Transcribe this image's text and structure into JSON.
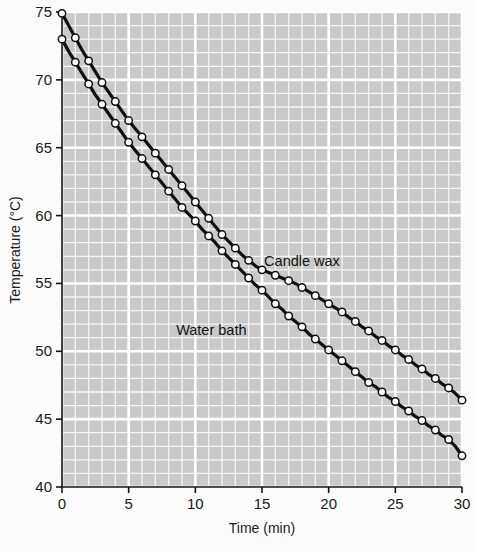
{
  "chart_data": {
    "type": "line",
    "title": "",
    "xlabel": "Time (min)",
    "ylabel": "Temperature (°C)",
    "xlim": [
      0,
      30
    ],
    "ylim": [
      40,
      75
    ],
    "xticks": [
      "0",
      "5",
      "10",
      "15",
      "20",
      "25",
      "30"
    ],
    "yticks": [
      "40",
      "45",
      "50",
      "55",
      "60",
      "65",
      "70",
      "75"
    ],
    "xtick_values": [
      0,
      5,
      10,
      15,
      20,
      25,
      30
    ],
    "ytick_values": [
      40,
      45,
      50,
      55,
      60,
      65,
      70,
      75
    ],
    "grid": true,
    "grid_major_step_x": 5,
    "grid_minor_step_x": 1,
    "grid_major_step_y": 5,
    "grid_minor_step_y": 1,
    "legend_position": "inline-annotation",
    "plot_background_color": "#c9c9c9",
    "grid_color": "#f5f5f5",
    "marker_style": "open-circle",
    "marker_face_color": "#ffffff",
    "marker_edge_color": "#101010",
    "line_color": "#101010",
    "series": [
      {
        "name": "Candle wax",
        "annotation_x": 18.0,
        "annotation_y": 56.3,
        "x": [
          0,
          0.5,
          1,
          1.5,
          2,
          2.5,
          3,
          3.5,
          4,
          4.5,
          5,
          5.5,
          6,
          6.5,
          7,
          7.5,
          8,
          8.5,
          9,
          9.5,
          10,
          10.5,
          11,
          11.5,
          12,
          12.5,
          13,
          13.5,
          14,
          14.5,
          15,
          15.5,
          16,
          16.5,
          17,
          17.5,
          18,
          18.5,
          19,
          19.5,
          20,
          20.5,
          21,
          21.5,
          22,
          22.5,
          23,
          23.5,
          24,
          24.5,
          25,
          25.5,
          26,
          26.5,
          27,
          27.5,
          28,
          28.5,
          29,
          29.5,
          30
        ],
        "values": [
          74.9,
          74.0,
          73.1,
          72.2,
          71.4,
          70.6,
          69.8,
          69.1,
          68.4,
          67.7,
          67.0,
          66.4,
          65.8,
          65.2,
          64.6,
          64.0,
          63.4,
          62.8,
          62.2,
          61.6,
          61.0,
          60.4,
          59.8,
          59.2,
          58.6,
          58.1,
          57.6,
          57.1,
          56.7,
          56.3,
          56.0,
          55.8,
          55.6,
          55.4,
          55.2,
          55.0,
          54.7,
          54.4,
          54.1,
          53.8,
          53.5,
          53.2,
          52.9,
          52.5,
          52.2,
          51.8,
          51.5,
          51.1,
          50.8,
          50.4,
          50.1,
          49.7,
          49.4,
          49.0,
          48.7,
          48.3,
          48.0,
          47.6,
          47.3,
          46.9,
          46.4
        ]
      },
      {
        "name": "Water bath",
        "annotation_x": 11.2,
        "annotation_y": 51.2,
        "x": [
          0,
          0.5,
          1,
          1.5,
          2,
          2.5,
          3,
          3.5,
          4,
          4.5,
          5,
          5.5,
          6,
          6.5,
          7,
          7.5,
          8,
          8.5,
          9,
          9.5,
          10,
          10.5,
          11,
          11.5,
          12,
          12.5,
          13,
          13.5,
          14,
          14.5,
          15,
          15.5,
          16,
          16.5,
          17,
          17.5,
          18,
          18.5,
          19,
          19.5,
          20,
          20.5,
          21,
          21.5,
          22,
          22.5,
          23,
          23.5,
          24,
          24.5,
          25,
          25.5,
          26,
          26.5,
          27,
          27.5,
          28,
          28.5,
          29,
          29.5,
          30
        ],
        "values": [
          73.0,
          72.1,
          71.3,
          70.5,
          69.7,
          68.9,
          68.2,
          67.5,
          66.8,
          66.1,
          65.4,
          64.8,
          64.2,
          63.6,
          63.0,
          62.4,
          61.8,
          61.2,
          60.6,
          60.1,
          59.6,
          59.0,
          58.5,
          58.0,
          57.4,
          56.9,
          56.4,
          55.9,
          55.4,
          54.9,
          54.5,
          54.0,
          53.5,
          53.1,
          52.6,
          52.2,
          51.8,
          51.3,
          50.9,
          50.5,
          50.1,
          49.7,
          49.3,
          48.9,
          48.5,
          48.1,
          47.7,
          47.4,
          47.0,
          46.6,
          46.3,
          45.9,
          45.6,
          45.2,
          44.9,
          44.5,
          44.2,
          43.8,
          43.5,
          43.0,
          42.3
        ]
      }
    ]
  }
}
